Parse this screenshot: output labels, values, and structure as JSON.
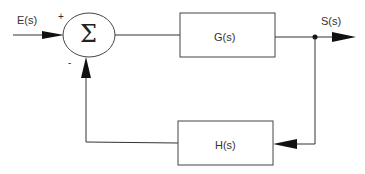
{
  "diagram": {
    "type": "feedback-control-block-diagram",
    "input_label": "E(s)",
    "output_label": "S(s)",
    "summing_junction": {
      "symbol": "Σ",
      "plus_sign": "+",
      "minus_sign": "-"
    },
    "forward_block": {
      "label": "G(s)"
    },
    "feedback_block": {
      "label": "H(s)"
    }
  },
  "colors": {
    "stroke": "#333333",
    "background": "#ffffff"
  }
}
